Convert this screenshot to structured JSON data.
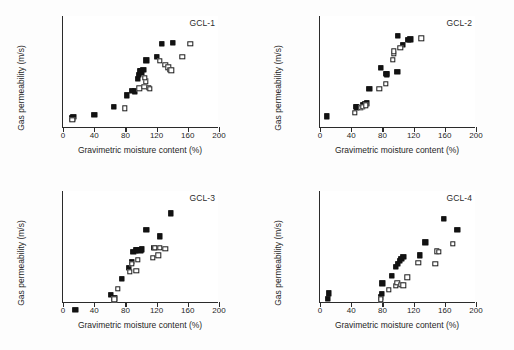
{
  "figure": {
    "panel_count": 4,
    "axis": {
      "xlabel": "Gravimetric moisture content (%)",
      "ylabel": "Gas permeability (m/s)",
      "xlim": [
        0,
        200
      ],
      "xticks": [
        0,
        40,
        80,
        120,
        160,
        200
      ],
      "xtick_labels": [
        "0",
        "40",
        "80",
        "120",
        "160",
        "200"
      ],
      "ylim_exp": [
        -14,
        -6
      ],
      "yticks_exp": [
        -6,
        -8,
        -10,
        -12,
        -14
      ],
      "ytick_labels": [
        "1.0E-06",
        "1.0E-08",
        "1.0E-10",
        "1.0E-12",
        "1.0E-14"
      ],
      "yscale": "log",
      "grid": "off",
      "legend": "none"
    }
  },
  "chart_data": [
    {
      "type": "scatter",
      "title": "GCL-1",
      "xlabel": "Gravimetric moisture content (%)",
      "ylabel": "Gas permeability (m/s)",
      "xlim": [
        0,
        200
      ],
      "ylim": [
        1e-14,
        1e-06
      ],
      "yscale": "log",
      "series": [
        {
          "name": "filled-square",
          "marker": "filled",
          "points": [
            [
              12,
              2e-07
            ],
            [
              13,
              1.6e-07
            ],
            [
              40,
              1.2e-07
            ],
            [
              65,
              3.2e-08
            ],
            [
              82,
              4.5e-09
            ],
            [
              88,
              2.2e-09
            ],
            [
              92,
              2.4e-09
            ],
            [
              96,
              3e-10
            ],
            [
              97,
              1.6e-10
            ],
            [
              99,
              9e-11
            ],
            [
              100,
              8e-11
            ],
            [
              101,
              1.1e-10
            ],
            [
              103,
              7e-11
            ],
            [
              107,
              1.5e-11
            ],
            [
              120,
              8.5e-12
            ],
            [
              127,
              1e-12
            ],
            [
              141,
              8e-13
            ]
          ]
        },
        {
          "name": "open-square",
          "marker": "open",
          "points": [
            [
              12,
              2.6e-07
            ],
            [
              79,
              4e-08
            ],
            [
              98,
              1.5e-09
            ],
            [
              104,
              1.1e-09
            ],
            [
              106,
              4.5e-10
            ],
            [
              110,
              1.4e-09
            ],
            [
              111,
              1.6e-09
            ],
            [
              105,
              2.6e-10
            ],
            [
              124,
              1.6e-11
            ],
            [
              131,
              3e-11
            ],
            [
              135,
              4.5e-11
            ],
            [
              137,
              7e-11
            ],
            [
              139,
              7.5e-11
            ],
            [
              153,
              8e-12
            ],
            [
              163,
              1e-12
            ]
          ]
        }
      ]
    },
    {
      "type": "scatter",
      "title": "GCL-2",
      "xlabel": "Gravimetric moisture content (%)",
      "ylabel": "Gas permeability (m/s)",
      "xlim": [
        0,
        200
      ],
      "ylim": [
        1e-14,
        1e-06
      ],
      "yscale": "log",
      "series": [
        {
          "name": "filled-square",
          "marker": "filled",
          "points": [
            [
              9,
              1.5e-07
            ],
            [
              46,
              3e-08
            ],
            [
              47,
              3.4e-08
            ],
            [
              55,
              2.2e-08
            ],
            [
              58,
              1.8e-08
            ],
            [
              60,
              1.7e-08
            ],
            [
              63,
              1.6e-09
            ],
            [
              78,
              5e-11
            ],
            [
              85,
              1.3e-10
            ],
            [
              86,
              1.5e-10
            ],
            [
              99,
              1e-10
            ],
            [
              100,
              2.5e-13
            ],
            [
              106,
              1.2e-12
            ],
            [
              113,
              5e-13
            ],
            [
              116,
              4.5e-13
            ]
          ]
        },
        {
          "name": "open-square",
          "marker": "open",
          "points": [
            [
              45,
              8e-08
            ],
            [
              52,
              3.6e-08
            ],
            [
              55,
              3e-08
            ],
            [
              59,
              2.4e-08
            ],
            [
              76,
              1.6e-09
            ],
            [
              84,
              7e-10
            ],
            [
              93,
              1.3e-11
            ],
            [
              95,
              5e-12
            ],
            [
              95,
              3.4e-12
            ],
            [
              103,
              1.8e-12
            ],
            [
              130,
              4e-13
            ]
          ]
        }
      ]
    },
    {
      "type": "scatter",
      "title": "GCL-3",
      "xlabel": "Gravimetric moisture content (%)",
      "ylabel": "Gas permeability (m/s)",
      "xlim": [
        0,
        200
      ],
      "ylim": [
        1e-14,
        1e-06
      ],
      "yscale": "log",
      "series": [
        {
          "name": "filled-square",
          "marker": "filled",
          "points": [
            [
              16,
              3.2e-06
            ],
            [
              61,
              2.6e-07
            ],
            [
              66,
              4.5e-07
            ],
            [
              75,
              1.8e-08
            ],
            [
              84,
              3e-09
            ],
            [
              88,
              1.2e-09
            ],
            [
              90,
              2.2e-10
            ],
            [
              93,
              1.7e-10
            ],
            [
              95,
              1.6e-10
            ],
            [
              99,
              1.7e-10
            ],
            [
              101,
              1.5e-10
            ],
            [
              107,
              6e-12
            ],
            [
              117,
              1.2e-10
            ],
            [
              124,
              1.7e-11
            ],
            [
              138,
              4e-13
            ]
          ]
        },
        {
          "name": "open-square",
          "marker": "open",
          "points": [
            [
              66,
              5.5e-07
            ],
            [
              70,
              1e-07
            ],
            [
              86,
              6e-09
            ],
            [
              88,
              1.6e-09
            ],
            [
              94,
              5e-09
            ],
            [
              96,
              8e-10
            ],
            [
              115,
              6e-10
            ],
            [
              118,
              1.2e-10
            ],
            [
              122,
              4e-10
            ],
            [
              124,
              1.2e-10
            ],
            [
              131,
              1.3e-10
            ]
          ]
        }
      ]
    },
    {
      "type": "scatter",
      "title": "GCL-4",
      "xlabel": "Gravimetric moisture content (%)",
      "ylabel": "Gas permeability (m/s)",
      "xlim": [
        0,
        200
      ],
      "ylim": [
        1e-14,
        1e-06
      ],
      "yscale": "log",
      "series": [
        {
          "name": "filled-square",
          "marker": "filled",
          "points": [
            [
              10,
              5e-07
            ],
            [
              11,
              2e-07
            ],
            [
              78,
              4e-07
            ],
            [
              79,
              2.2e-07
            ],
            [
              80,
              4e-08
            ],
            [
              92,
              1.2e-08
            ],
            [
              97,
              2.6e-09
            ],
            [
              100,
              1.6e-09
            ],
            [
              102,
              1e-09
            ],
            [
              104,
              7e-10
            ],
            [
              107,
              5e-10
            ],
            [
              128,
              4e-10
            ],
            [
              135,
              4.5e-11
            ],
            [
              159,
              1e-12
            ],
            [
              176,
              6e-12
            ]
          ]
        },
        {
          "name": "open-square",
          "marker": "open",
          "points": [
            [
              78,
              5.5e-07
            ],
            [
              88,
              1.2e-07
            ],
            [
              97,
              6e-08
            ],
            [
              99,
              3.5e-08
            ],
            [
              104,
              5e-08
            ],
            [
              107,
              5.5e-08
            ],
            [
              112,
              1.5e-08
            ],
            [
              126,
              1.4e-09
            ],
            [
              148,
              1.6e-09
            ],
            [
              150,
              2e-10
            ],
            [
              152,
              2.2e-10
            ],
            [
              170,
              6e-11
            ]
          ]
        }
      ]
    }
  ]
}
